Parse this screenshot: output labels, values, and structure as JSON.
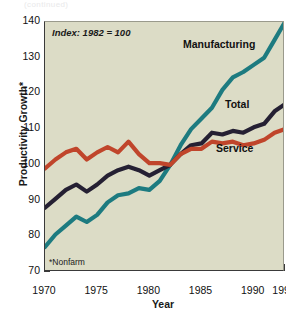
{
  "page": {
    "top_clipped_text": "(continued)"
  },
  "axes": {
    "y_title": "Productivity Growth*",
    "x_title": "Year",
    "y_ticks": [
      70,
      80,
      90,
      100,
      110,
      120,
      130,
      140
    ],
    "x_ticks_major": [
      1970,
      1975,
      1980,
      1985,
      1990,
      1993
    ]
  },
  "annotations": {
    "index_note": "Index: 1982 = 100",
    "footnote": "*Nonfarm"
  },
  "series_labels": {
    "manufacturing": "Manufacturing",
    "total": "Total",
    "service": "Service"
  },
  "colors": {
    "plot_background": "#dcdcc6",
    "page_background": "#ffffff",
    "axis": "#3a3a3a",
    "manufacturing": "#1d7b80",
    "total": "#252033",
    "service": "#c0452b"
  },
  "chart_data": {
    "type": "line",
    "title": "",
    "subtitle": "Index: 1982 = 100",
    "xlabel": "Year",
    "ylabel": "Productivity Growth*",
    "xlim": [
      1970,
      1993
    ],
    "ylim": [
      70,
      140
    ],
    "grid": false,
    "legend": "inline-labels",
    "note": "*Nonfarm",
    "x": [
      1970,
      1971,
      1972,
      1973,
      1974,
      1975,
      1976,
      1977,
      1978,
      1979,
      1980,
      1981,
      1982,
      1983,
      1984,
      1985,
      1986,
      1987,
      1988,
      1989,
      1990,
      1991,
      1992,
      1993
    ],
    "series": [
      {
        "name": "Manufacturing",
        "color": "#1d7b80",
        "values": [
          77.0,
          80.5,
          83.0,
          85.5,
          84.0,
          86.0,
          89.5,
          91.5,
          92.0,
          93.5,
          93.0,
          95.5,
          100.0,
          105.5,
          110.0,
          113.0,
          116.0,
          121.0,
          124.5,
          126.0,
          128.0,
          130.0,
          135.0,
          140.0
        ]
      },
      {
        "name": "Total",
        "color": "#252033",
        "values": [
          88.0,
          90.5,
          93.0,
          94.5,
          92.5,
          94.5,
          97.0,
          98.5,
          99.5,
          98.5,
          97.0,
          98.5,
          100.0,
          103.0,
          105.5,
          106.0,
          109.0,
          108.5,
          109.5,
          109.0,
          110.5,
          111.5,
          115.0,
          117.0
        ]
      },
      {
        "name": "Service",
        "color": "#c0452b",
        "values": [
          99.0,
          101.5,
          103.5,
          104.5,
          101.5,
          103.5,
          105.0,
          103.5,
          106.5,
          103.0,
          100.5,
          100.5,
          100.0,
          103.0,
          104.5,
          104.5,
          106.5,
          106.0,
          106.5,
          105.5,
          106.0,
          107.0,
          109.0,
          110.0
        ]
      }
    ]
  }
}
